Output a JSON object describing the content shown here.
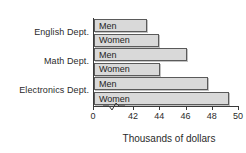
{
  "chart_data": {
    "type": "bar",
    "orientation": "horizontal",
    "title": "",
    "xlabel": "Thousands of dollars",
    "ylabel": "",
    "xlim": [
      42,
      50
    ],
    "axis_break": true,
    "axis_origin_label": "0",
    "grid": false,
    "legend": "none",
    "xticks": [
      42,
      44,
      46,
      48,
      50
    ],
    "xtick_labels": [
      "42",
      "44",
      "46",
      "48",
      "50"
    ],
    "categories": [
      "English Dept.",
      "Math Dept.",
      "Electronics Dept."
    ],
    "bars": [
      {
        "group": "English Dept.",
        "label": "Men",
        "value": 43.0
      },
      {
        "group": "English Dept.",
        "label": "Women",
        "value": 43.9
      },
      {
        "group": "Math Dept.",
        "label": "Men",
        "value": 46.0
      },
      {
        "group": "Math Dept.",
        "label": "Women",
        "value": 44.0
      },
      {
        "group": "Electronics Dept.",
        "label": "Men",
        "value": 47.6
      },
      {
        "group": "Electronics Dept.",
        "label": "Women",
        "value": 49.2
      }
    ],
    "series": [
      {
        "name": "Men",
        "values": [
          43.0,
          46.0,
          47.6
        ]
      },
      {
        "name": "Women",
        "values": [
          43.9,
          44.0,
          49.2
        ]
      }
    ],
    "colors": {
      "bar_fill": "#d9d9d9",
      "bar_stroke": "#5a5a5a",
      "axis": "#3a3a3a",
      "text": "#2b2b2b",
      "background": "#ffffff"
    }
  },
  "labels": {
    "english": "English Dept.",
    "math": "Math Dept.",
    "electronics": "Electronics Dept."
  },
  "bar_labels": {
    "english_men": "Men",
    "english_women": "Women",
    "math_men": "Men",
    "math_women": "Women",
    "electronics_men": "Men",
    "electronics_women": "Women"
  },
  "axis": {
    "origin": "0",
    "t42": "42",
    "t44": "44",
    "t46": "46",
    "t48": "48",
    "t50": "50",
    "x_title": "Thousands of dollars"
  }
}
